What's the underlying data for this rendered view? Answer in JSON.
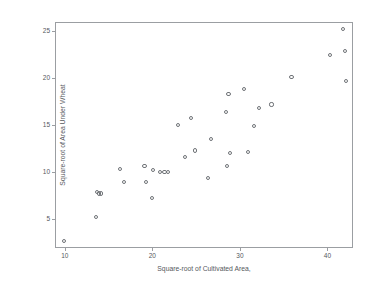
{
  "chart_data": {
    "type": "scatter",
    "title": "",
    "xlabel": "Square-root of Cultivated Area,",
    "ylabel": "Square-root of Area Under Wheat",
    "xlim": [
      9.0,
      42.8
    ],
    "ylim": [
      2.0,
      25.9
    ],
    "grid": false,
    "legend": null,
    "xticks": [
      10,
      20,
      30,
      40
    ],
    "xtick_labels": [
      "10",
      "20",
      "30",
      "40"
    ],
    "yticks": [
      5,
      10,
      15,
      20,
      25
    ],
    "ytick_labels": [
      "5",
      "10",
      "15",
      "20",
      "25"
    ],
    "marker": "open-circle",
    "marker_color": "#6f7377",
    "points": [
      {
        "x": 9.9,
        "y": 2.6
      },
      {
        "x": 13.6,
        "y": 5.2
      },
      {
        "x": 13.7,
        "y": 7.9
      },
      {
        "x": 13.9,
        "y": 7.7
      },
      {
        "x": 14.1,
        "y": 7.7
      },
      {
        "x": 16.3,
        "y": 10.3
      },
      {
        "x": 16.8,
        "y": 8.9
      },
      {
        "x": 19.1,
        "y": 10.6
      },
      {
        "x": 19.3,
        "y": 8.9
      },
      {
        "x": 20.0,
        "y": 7.2
      },
      {
        "x": 20.1,
        "y": 10.2
      },
      {
        "x": 20.9,
        "y": 10.0
      },
      {
        "x": 21.4,
        "y": 10.0
      },
      {
        "x": 21.8,
        "y": 10.0
      },
      {
        "x": 22.9,
        "y": 15.0
      },
      {
        "x": 23.7,
        "y": 11.6
      },
      {
        "x": 24.4,
        "y": 15.8
      },
      {
        "x": 24.9,
        "y": 12.3
      },
      {
        "x": 26.4,
        "y": 9.4
      },
      {
        "x": 26.7,
        "y": 13.5
      },
      {
        "x": 28.4,
        "y": 16.4
      },
      {
        "x": 28.5,
        "y": 10.6
      },
      {
        "x": 28.7,
        "y": 18.3
      },
      {
        "x": 28.9,
        "y": 12.0
      },
      {
        "x": 30.5,
        "y": 18.9
      },
      {
        "x": 30.9,
        "y": 12.1
      },
      {
        "x": 31.6,
        "y": 14.9
      },
      {
        "x": 32.2,
        "y": 16.8
      },
      {
        "x": 33.6,
        "y": 17.2
      },
      {
        "x": 35.9,
        "y": 20.1
      },
      {
        "x": 40.3,
        "y": 22.5
      },
      {
        "x": 41.8,
        "y": 25.3
      },
      {
        "x": 42.0,
        "y": 22.9
      },
      {
        "x": 42.1,
        "y": 19.7
      }
    ]
  }
}
